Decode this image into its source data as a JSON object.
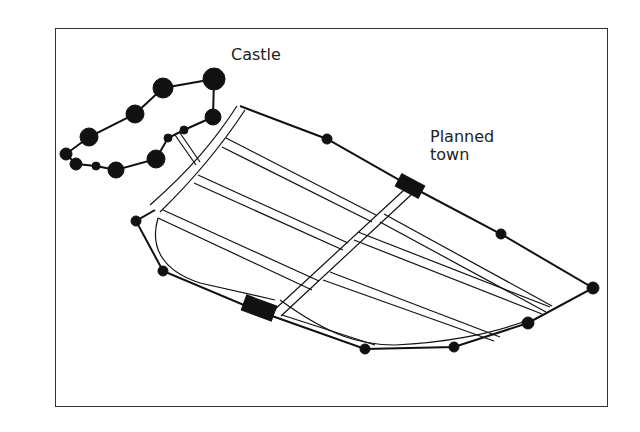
{
  "diagram": {
    "labels": {
      "castle": "Castle",
      "town_line1": "Planned",
      "town_line2": "town"
    },
    "colors": {
      "ink": "#111111",
      "frame": "#333333",
      "background": "#ffffff"
    },
    "elements": [
      {
        "name": "castle",
        "type": "fortified enclosure with towers"
      },
      {
        "name": "planned-town",
        "type": "walled town with grid of streets"
      },
      {
        "name": "town-gate-north",
        "type": "gate"
      },
      {
        "name": "town-gate-south",
        "type": "gate"
      }
    ]
  }
}
